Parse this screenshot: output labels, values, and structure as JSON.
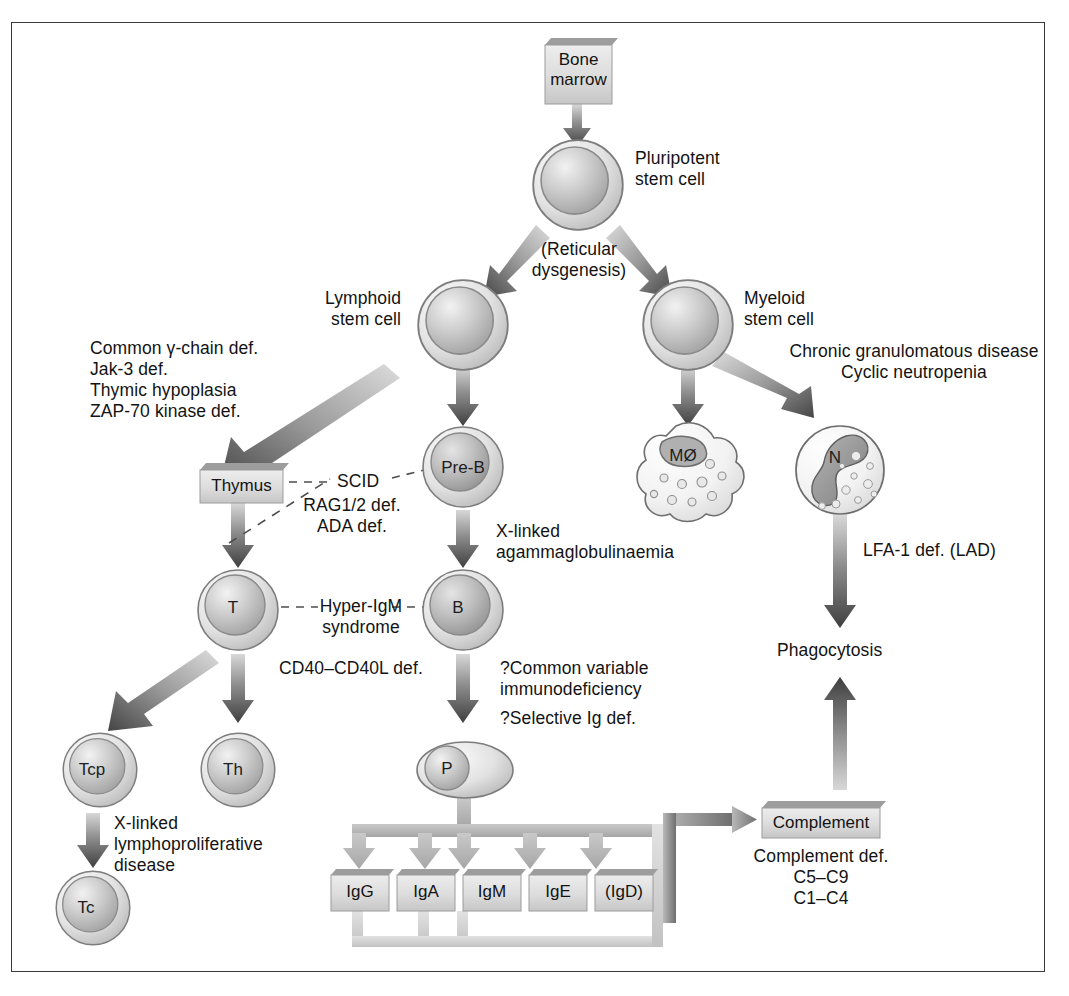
{
  "figure": {
    "type": "flow-diagram"
  },
  "boxes": {
    "bone_marrow": "Bone\nmarrow",
    "thymus": "Thymus",
    "complement": "Complement",
    "ig": [
      "IgG",
      "IgA",
      "IgM",
      "IgE",
      "(IgD)"
    ]
  },
  "cells": {
    "pluripotent": "",
    "lymphoid": "",
    "myeloid": "",
    "pre_b": "Pre-B",
    "t": "T",
    "b": "B",
    "tcp": "Tcp",
    "th": "Th",
    "tc": "Tc",
    "p": "P",
    "macrophage": "MØ",
    "neutrophil": "N"
  },
  "labels": {
    "pluripotent": "Pluripotent\nstem cell",
    "lymphoid": "Lymphoid\nstem cell",
    "myeloid": "Myeloid\nstem cell",
    "reticular": "(Reticular\ndysgenesis)",
    "phagocytosis": "Phagocytosis"
  },
  "defects": {
    "scid_group": "Common γ-chain def.\nJak-3 def.\nThymic hypoplasia\nZAP-70 kinase def.",
    "scid": "SCID",
    "scid_sub": "RAG1/2 def.\nADA def.",
    "x_linked_agamma": "X-linked\nagammaglobulinaemia",
    "hyper_igm": "Hyper-IgM\nsyndrome",
    "cd40": "CD40–CD40L def.",
    "cvid": "?Common variable\nimmunodeficiency",
    "selective_ig": "?Selective Ig def.",
    "xlp": "X-linked\nlymphoproliferative\ndisease",
    "cgd": "Chronic granulomatous disease\nCyclic neutropenia",
    "lfa1": "LFA-1 def. (LAD)",
    "complement_def": "Complement def.\nC5–C9\nC1–C4"
  },
  "colors": {
    "box_fill": "#d9d9d9",
    "box_shadow": "#9a9a9a",
    "arrow_dark": "#4a4a4a",
    "arrow_light": "#cfcfcf",
    "cell_ring": "#8c8c8c",
    "border": "#3a3a3a"
  }
}
